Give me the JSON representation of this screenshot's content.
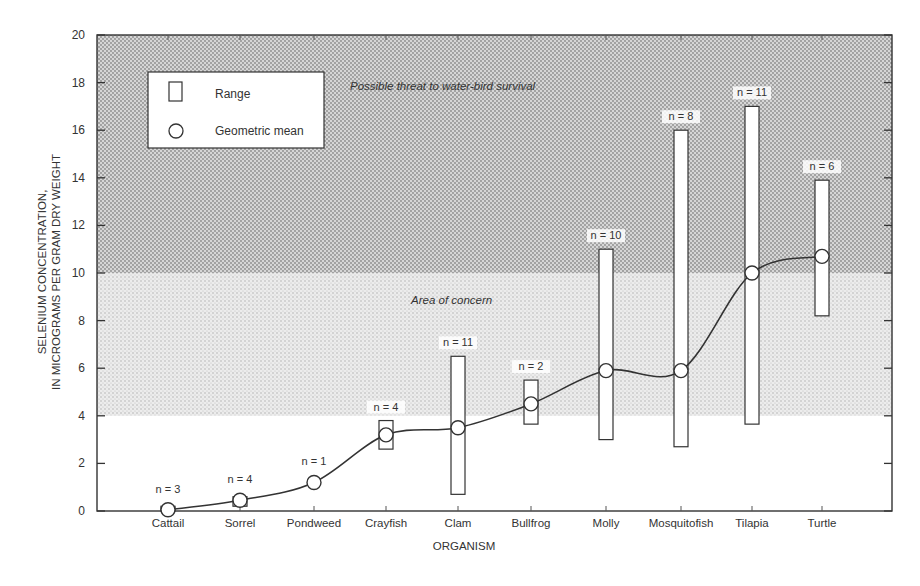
{
  "chart_data": {
    "type": "range-mean",
    "title": "",
    "xlabel": "ORGANISM",
    "ylabel_line1": "SELENIUM CONCENTRATION,",
    "ylabel_line2": "IN MICROGRAMS PER GRAM DRY WEIGHT",
    "ylim": [
      0,
      20
    ],
    "yticks": [
      0,
      2,
      4,
      6,
      8,
      10,
      12,
      14,
      16,
      18,
      20
    ],
    "grid": false,
    "legend": {
      "position": "upper-left",
      "entries": [
        {
          "symbol": "rectangle",
          "label": "Range"
        },
        {
          "symbol": "circle",
          "label": "Geometric mean"
        }
      ]
    },
    "zones": [
      {
        "label": "Possible threat to water-bird survival",
        "from": 10,
        "to": 20,
        "shade": "dark"
      },
      {
        "label": "Area of concern",
        "from": 4,
        "to": 10,
        "shade": "light"
      }
    ],
    "categories": [
      "Cattail",
      "Sorrel",
      "Pondweed",
      "Crayfish",
      "Clam",
      "Bullfrog",
      "Molly",
      "Mosquitofish",
      "Tilapia",
      "Turtle"
    ],
    "n": [
      "n = 3",
      "n = 4",
      "n = 1",
      "n = 4",
      "n = 11",
      "n = 2",
      "n = 10",
      "n = 8",
      "n = 11",
      "n = 6"
    ],
    "range_min": [
      0.0,
      0.2,
      null,
      2.6,
      0.7,
      3.65,
      3.0,
      2.7,
      3.65,
      8.2
    ],
    "range_max": [
      0.2,
      0.6,
      null,
      3.8,
      6.5,
      5.5,
      11.0,
      16.0,
      17.0,
      13.9
    ],
    "geometric_mean": [
      0.05,
      0.45,
      1.2,
      3.2,
      3.5,
      4.5,
      5.9,
      5.9,
      10.0,
      10.7
    ],
    "trend_curve": "smooth line through geometric means"
  }
}
